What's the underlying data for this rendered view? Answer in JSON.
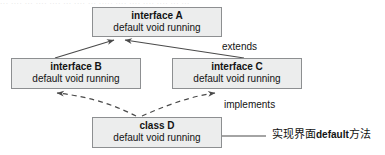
{
  "diagram": {
    "type": "uml-class-diagram",
    "top_artifact_text": "··· ···· ··· ···· ···· ··· ···· ··· ····· ···· ···· ···· ···· ··· ···",
    "boxes": [
      {
        "id": "a",
        "title": "interface A",
        "member": "default void running",
        "x": 92,
        "y": 7,
        "w": 130,
        "h": 30
      },
      {
        "id": "b",
        "title": "interface B",
        "member": "default void running",
        "x": 11,
        "y": 58,
        "w": 130,
        "h": 31
      },
      {
        "id": "c",
        "title": "interface C",
        "member": "default void running",
        "x": 172,
        "y": 58,
        "w": 130,
        "h": 31
      },
      {
        "id": "d",
        "title": "class D",
        "member": "default void running",
        "x": 92,
        "y": 117,
        "w": 130,
        "h": 31
      }
    ],
    "edges": [
      {
        "id": "b-extends-a",
        "from": "interface B",
        "to": "interface A",
        "style": "solid",
        "arrow": "open",
        "label": ""
      },
      {
        "id": "c-extends-a",
        "from": "interface C",
        "to": "interface A",
        "style": "solid",
        "arrow": "open",
        "label": "extends"
      },
      {
        "id": "d-implements-b",
        "from": "class D",
        "to": "interface B",
        "style": "dashed",
        "arrow": "open",
        "label": ""
      },
      {
        "id": "d-implements-c",
        "from": "class D",
        "to": "interface C",
        "style": "dashed",
        "arrow": "open",
        "label": "implements"
      },
      {
        "id": "note-to-d",
        "from": "annotation",
        "to": "class D",
        "style": "solid",
        "arrow": "open",
        "label": ""
      }
    ],
    "labels": {
      "extends": "extends",
      "implements": "implements"
    },
    "annotation": {
      "text_prefix": "实现界面",
      "text_keyword": "default",
      "text_suffix": "方法",
      "full_text": "实现界面default方法"
    },
    "colors": {
      "box_fill": "#eceded",
      "box_border": "#8d8f91",
      "line": "#4a4a4a",
      "text": "#131313",
      "background": "#ffffff"
    }
  }
}
